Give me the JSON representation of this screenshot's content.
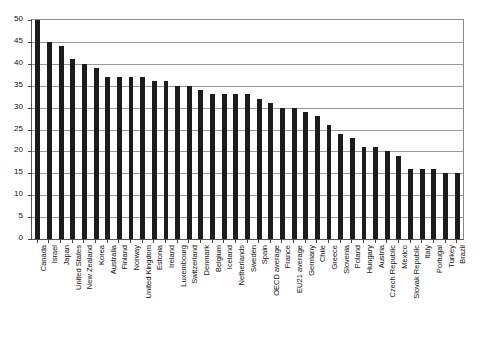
{
  "chart_data": {
    "type": "bar",
    "title": "",
    "subtitle": "",
    "xlabel": "",
    "ylabel": "",
    "ylim": [
      0,
      50
    ],
    "ytick_step": 5,
    "yticks": [
      0,
      5,
      10,
      15,
      20,
      25,
      30,
      35,
      40,
      45,
      50
    ],
    "ytick_labels": [
      "0",
      "5",
      "10",
      "15",
      "20",
      "25",
      "30",
      "35",
      "40",
      "45",
      "50"
    ],
    "grid": true,
    "legend": false,
    "legend_position": "none",
    "bar_color": "#1c1c1c",
    "categories": [
      "Canada",
      "Israel",
      "Japan",
      "United States",
      "New Zealand",
      "Korea",
      "Australia",
      "Finland",
      "Norway",
      "United Kingdom",
      "Estonia",
      "Ireland",
      "Luxembourg",
      "Switzerland",
      "Denmark",
      "Belgium",
      "Iceland",
      "Netherlands",
      "Sweden",
      "Spain",
      "OECD average",
      "France",
      "EU21 average",
      "Germany",
      "Chile",
      "Greece",
      "Slovenia",
      "Poland",
      "Hungary",
      "Austria",
      "Czech Republic",
      "Mexico",
      "Slovak Republic",
      "Italy",
      "Portugal",
      "Turkey",
      "Brazil"
    ],
    "values": [
      50,
      45,
      44,
      41,
      40,
      39,
      37,
      37,
      37,
      37,
      36,
      36,
      35,
      35,
      34,
      33,
      33,
      33,
      33,
      32,
      31,
      30,
      30,
      29,
      28,
      26,
      24,
      23,
      21,
      21,
      20,
      19,
      16,
      16,
      16,
      15,
      15
    ]
  }
}
